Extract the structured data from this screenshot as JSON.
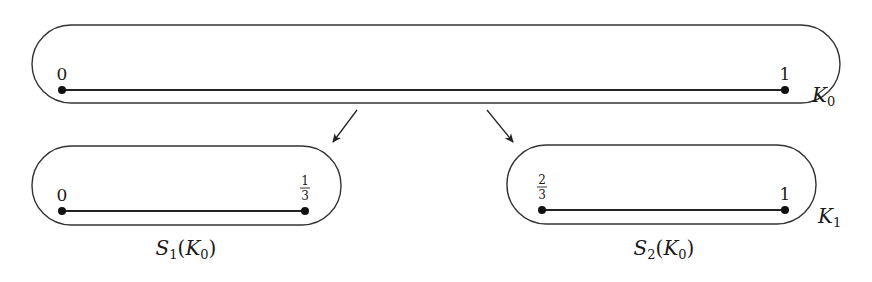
{
  "diagram": {
    "top": {
      "endpoints": {
        "left": "0",
        "right": "1"
      },
      "set_label": {
        "base": "K",
        "sub": "0"
      }
    },
    "arrows": [
      {
        "from": "K0",
        "to": "S1(K0)"
      },
      {
        "from": "K0",
        "to": "S2(K0)"
      }
    ],
    "left": {
      "endpoints": {
        "left": "0",
        "right_num": "1",
        "right_den": "3"
      },
      "caption": {
        "fn": "S",
        "fn_sub": "1",
        "open": "(",
        "arg": "K",
        "arg_sub": "0",
        "close": ")"
      }
    },
    "right": {
      "endpoints": {
        "left_num": "2",
        "left_den": "3",
        "right": "1"
      },
      "set_label": {
        "base": "K",
        "sub": "1"
      },
      "caption": {
        "fn": "S",
        "fn_sub": "2",
        "open": "(",
        "arg": "K",
        "arg_sub": "0",
        "close": ")"
      }
    }
  }
}
